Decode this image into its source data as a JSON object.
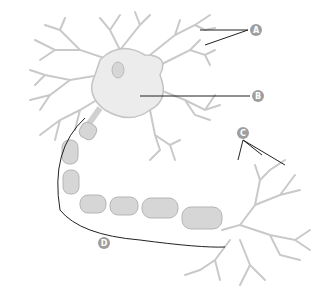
{
  "diagram": {
    "labels": [
      {
        "id": "A",
        "text": "A",
        "x": 256,
        "y": 30,
        "points_to": "dendrites"
      },
      {
        "id": "B",
        "text": "B",
        "x": 258,
        "y": 96,
        "points_to": "cell body"
      },
      {
        "id": "C",
        "text": "C",
        "x": 243,
        "y": 133,
        "points_to": "axon terminals"
      },
      {
        "id": "D",
        "text": "D",
        "x": 104,
        "y": 243,
        "points_to": "axon"
      }
    ],
    "colors": {
      "label_fill": "#9e9e9e",
      "label_text": "#ffffff",
      "leader_line": "#222222",
      "neuron_fill": "#ececec",
      "neuron_stroke": "#c4c4c4",
      "myelin_fill": "#d6d6d6",
      "myelin_stroke": "#b5b5b5"
    }
  }
}
